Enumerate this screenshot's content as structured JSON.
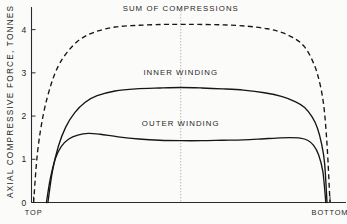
{
  "chart_data": {
    "type": "line",
    "title": "",
    "subtitle": "",
    "xlabel": "",
    "ylabel": "AXIAL COMPRESSIVE FORCE, TONNES",
    "xlim": [
      0,
      1
    ],
    "ylim": [
      0,
      4.5
    ],
    "grid": false,
    "legend_position": "inline-annotations",
    "y_ticks": [
      {
        "value": 0,
        "label": "0"
      },
      {
        "value": 1,
        "label": "1"
      },
      {
        "value": 2,
        "label": "2"
      },
      {
        "value": 3,
        "label": "3"
      },
      {
        "value": 4,
        "label": "4"
      }
    ],
    "x_ticks": [
      {
        "value": 0.007,
        "label": "TOP"
      },
      {
        "value": 1.0,
        "label": "BOTTOM"
      }
    ],
    "annotations": [
      {
        "text": "SUM OF COMPRESSIONS",
        "x": 0.5,
        "y": 4.42
      },
      {
        "text": "INNER WINDING",
        "x": 0.5,
        "y": 2.95
      },
      {
        "text": "OUTER WINDING",
        "x": 0.5,
        "y": 1.78
      }
    ],
    "center_marker": {
      "x": 0.5,
      "style": "dotted-vertical"
    },
    "series": [
      {
        "name": "SUM OF COMPRESSIONS",
        "style": "dashed",
        "color": "#161616",
        "x": [
          0.007,
          0.02,
          0.04,
          0.065,
          0.09,
          0.12,
          0.16,
          0.21,
          0.28,
          0.36,
          0.44,
          0.5,
          0.56,
          0.64,
          0.72,
          0.79,
          0.84,
          0.885,
          0.915,
          0.94,
          0.96,
          0.978,
          0.99,
          1.0
        ],
        "y": [
          0.0,
          1.15,
          2.05,
          2.72,
          3.16,
          3.48,
          3.76,
          3.94,
          4.06,
          4.1,
          4.12,
          4.12,
          4.12,
          4.11,
          4.08,
          4.02,
          3.93,
          3.78,
          3.6,
          3.3,
          2.92,
          2.3,
          1.35,
          0.0
        ]
      },
      {
        "name": "INNER WINDING",
        "style": "solid",
        "color": "#161616",
        "x": [
          0.055,
          0.07,
          0.09,
          0.115,
          0.145,
          0.18,
          0.22,
          0.28,
          0.35,
          0.43,
          0.5,
          0.57,
          0.64,
          0.71,
          0.78,
          0.84,
          0.885,
          0.915,
          0.94,
          0.958,
          0.972,
          0.982,
          0.99
        ],
        "y": [
          0.0,
          0.72,
          1.3,
          1.75,
          2.08,
          2.32,
          2.47,
          2.58,
          2.63,
          2.65,
          2.66,
          2.65,
          2.63,
          2.6,
          2.54,
          2.45,
          2.33,
          2.2,
          1.98,
          1.72,
          1.35,
          0.9,
          0.0
        ]
      },
      {
        "name": "OUTER WINDING",
        "style": "solid",
        "color": "#161616",
        "x": [
          0.05,
          0.063,
          0.08,
          0.1,
          0.125,
          0.155,
          0.19,
          0.23,
          0.29,
          0.36,
          0.43,
          0.5,
          0.57,
          0.64,
          0.71,
          0.77,
          0.82,
          0.865,
          0.9,
          0.925,
          0.945,
          0.962,
          0.976,
          0.986
        ],
        "y": [
          0.0,
          0.55,
          1.02,
          1.3,
          1.47,
          1.56,
          1.6,
          1.58,
          1.52,
          1.47,
          1.44,
          1.43,
          1.43,
          1.44,
          1.45,
          1.47,
          1.49,
          1.5,
          1.49,
          1.44,
          1.32,
          1.1,
          0.72,
          0.0
        ]
      }
    ]
  },
  "ylabel_text": "AXIAL COMPRESSIVE FORCE, TONNES"
}
